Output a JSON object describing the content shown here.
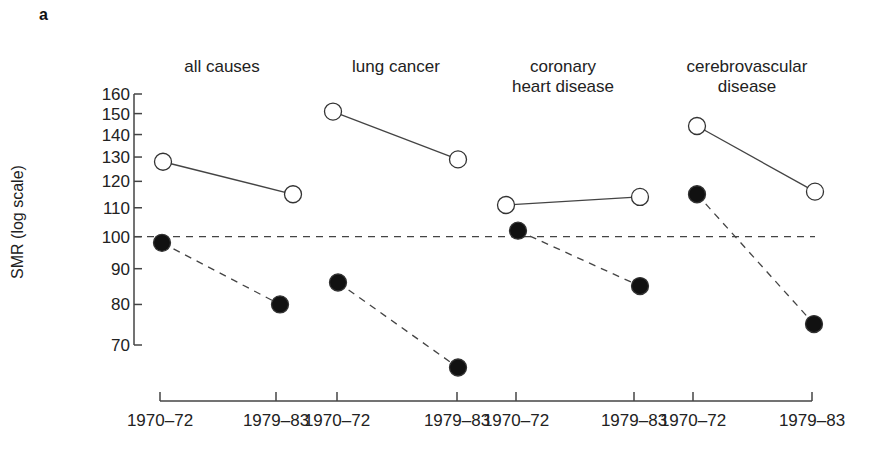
{
  "panel_label": "a",
  "chart_data": {
    "type": "line",
    "title": "",
    "ylabel": "SMR (log scale)",
    "xlabel": "",
    "yscale": "log",
    "ylim": [
      70,
      160
    ],
    "yticks": [
      160,
      150,
      140,
      130,
      120,
      110,
      100,
      90,
      80,
      70
    ],
    "reference_line": {
      "value": 100,
      "style": "dashed"
    },
    "grid": false,
    "legend": null,
    "panels": [
      {
        "title": "all causes",
        "categories": [
          "1970–72",
          "1979–83"
        ],
        "series": [
          {
            "name": "open circles (solid line)",
            "marker": "open-circle",
            "line": "solid",
            "values": [
              128,
              115
            ]
          },
          {
            "name": "filled circles (dashed line)",
            "marker": "filled-circle",
            "line": "dashed",
            "values": [
              98,
              80
            ]
          }
        ]
      },
      {
        "title": "lung cancer",
        "categories": [
          "1970–72",
          "1979–83"
        ],
        "series": [
          {
            "name": "open circles (solid line)",
            "marker": "open-circle",
            "line": "solid",
            "values": [
              151,
              129
            ]
          },
          {
            "name": "filled circles (dashed line)",
            "marker": "filled-circle",
            "line": "dashed",
            "values": [
              86,
              65
            ]
          }
        ]
      },
      {
        "title": "coronary heart disease",
        "categories": [
          "1970–72",
          "1979–83"
        ],
        "series": [
          {
            "name": "open circles (solid line)",
            "marker": "open-circle",
            "line": "solid",
            "values": [
              111,
              114
            ]
          },
          {
            "name": "filled circles (dashed line)",
            "marker": "filled-circle",
            "line": "dashed",
            "values": [
              102,
              85
            ]
          }
        ]
      },
      {
        "title": "cerebrovascular disease",
        "categories": [
          "1970–72",
          "1979–83"
        ],
        "series": [
          {
            "name": "open circles (solid line)",
            "marker": "open-circle",
            "line": "solid",
            "values": [
              144,
              116
            ]
          },
          {
            "name": "filled circles (dashed line)",
            "marker": "filled-circle",
            "line": "dashed",
            "values": [
              115,
              75
            ]
          }
        ]
      }
    ]
  },
  "panel_titles": [
    {
      "line1": "all causes",
      "line2": ""
    },
    {
      "line1": "lung cancer",
      "line2": ""
    },
    {
      "line1": "coronary",
      "line2": "heart disease"
    },
    {
      "line1": "cerebrovascular",
      "line2": "disease"
    }
  ],
  "x_tick_labels": [
    "1970–72",
    "1979–83",
    "1970–72",
    "1979–83",
    "1970–72",
    "1979–83",
    "1970–72",
    "1979–83"
  ],
  "colors": {
    "ink": "#222222",
    "line": "#444444",
    "background": "#ffffff"
  }
}
